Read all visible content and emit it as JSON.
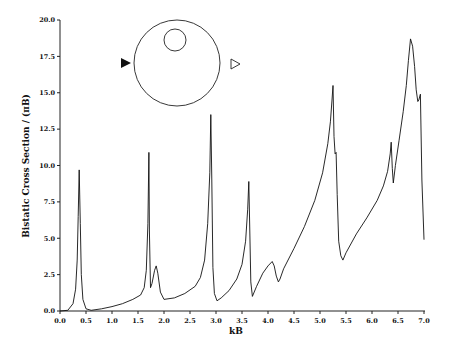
{
  "chart_data": {
    "type": "line",
    "title": "",
    "xlabel": "kB",
    "ylabel": "Bistatic Cross Section / (πB)",
    "xlim": [
      0.0,
      7.0
    ],
    "ylim": [
      0.0,
      20.0
    ],
    "x_ticks": [
      "0.0",
      "0.5",
      "1.0",
      "1.5",
      "2.0",
      "2.5",
      "3.0",
      "3.5",
      "4.0",
      "4.5",
      "5.0",
      "5.5",
      "6.0",
      "6.5",
      "7.0"
    ],
    "y_ticks": [
      "0.0",
      "2.5",
      "5.0",
      "7.5",
      "10.0",
      "12.5",
      "15.0",
      "17.5",
      "20.0"
    ],
    "grid": false,
    "legend": null,
    "inset": {
      "description": "Circle scatterer with off-center inner circle; incident wave (filled triangle) from left, observed (hollow triangle) at right",
      "outer_circle": {
        "cx": 177,
        "cy": 63,
        "r": 43
      },
      "inner_circle": {
        "cx": 175,
        "cy": 40,
        "r": 11
      },
      "incident_marker": "filled-triangle-right",
      "scattered_marker": "hollow-triangle-right"
    },
    "series": [
      {
        "name": "bistatic cross section",
        "x": [
          0.0,
          0.15,
          0.25,
          0.3,
          0.33,
          0.35,
          0.37,
          0.39,
          0.41,
          0.44,
          0.5,
          0.6,
          0.8,
          1.0,
          1.2,
          1.4,
          1.55,
          1.62,
          1.66,
          1.69,
          1.71,
          1.72,
          1.74,
          1.77,
          1.82,
          1.85,
          1.88,
          1.93,
          2.0,
          2.2,
          2.4,
          2.6,
          2.7,
          2.78,
          2.84,
          2.88,
          2.9,
          2.92,
          2.94,
          2.97,
          3.02,
          3.1,
          3.25,
          3.4,
          3.5,
          3.57,
          3.61,
          3.63,
          3.65,
          3.67,
          3.7,
          3.78,
          3.9,
          4.0,
          4.08,
          4.12,
          4.16,
          4.2,
          4.23,
          4.3,
          4.5,
          4.7,
          4.9,
          5.05,
          5.15,
          5.2,
          5.23,
          5.25,
          5.27,
          5.29,
          5.31,
          5.33,
          5.36,
          5.4,
          5.44,
          5.5,
          5.7,
          5.9,
          6.1,
          6.22,
          6.3,
          6.35,
          6.37,
          6.39,
          6.41,
          6.45,
          6.52,
          6.6,
          6.66,
          6.7,
          6.74,
          6.78,
          6.82,
          6.85,
          6.88,
          6.9,
          6.93,
          6.96,
          7.0
        ],
        "values": [
          0.0,
          0.05,
          0.5,
          1.5,
          3.5,
          6.5,
          9.7,
          6.0,
          2.5,
          0.8,
          0.15,
          0.05,
          0.15,
          0.3,
          0.5,
          0.8,
          1.1,
          1.6,
          2.8,
          6.0,
          10.9,
          5.5,
          1.6,
          1.9,
          2.8,
          3.1,
          2.6,
          1.3,
          0.8,
          0.9,
          1.2,
          1.7,
          2.3,
          3.5,
          6.0,
          9.5,
          13.5,
          9.0,
          3.0,
          1.2,
          0.7,
          0.9,
          1.4,
          2.2,
          3.2,
          4.8,
          7.0,
          8.9,
          5.5,
          2.0,
          1.0,
          1.7,
          2.6,
          3.1,
          3.4,
          3.1,
          2.4,
          2.0,
          2.2,
          2.9,
          4.3,
          5.8,
          7.6,
          9.5,
          11.5,
          13.0,
          14.5,
          15.5,
          12.0,
          10.8,
          10.9,
          8.0,
          4.8,
          3.8,
          3.5,
          4.0,
          5.3,
          6.4,
          7.6,
          8.6,
          9.6,
          10.8,
          11.6,
          9.8,
          8.8,
          10.0,
          11.7,
          13.7,
          15.5,
          17.2,
          18.7,
          18.2,
          16.8,
          15.2,
          14.4,
          14.5,
          14.9,
          9.0,
          4.9
        ]
      }
    ]
  }
}
